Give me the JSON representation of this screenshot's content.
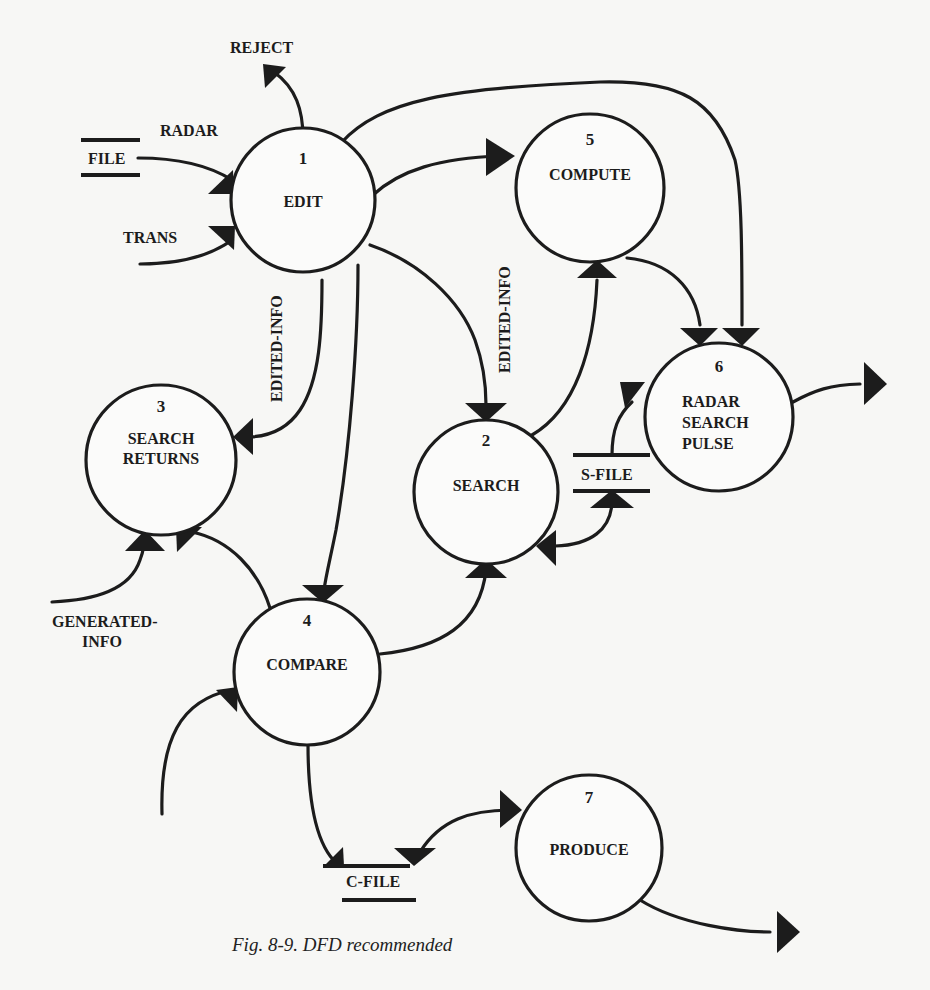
{
  "figure": {
    "caption": "Fig. 8-9. DFD recommended"
  },
  "processes": [
    {
      "id": "1",
      "number": "1",
      "name_lines": [
        "EDIT"
      ]
    },
    {
      "id": "2",
      "number": "2",
      "name_lines": [
        "SEARCH"
      ]
    },
    {
      "id": "3",
      "number": "3",
      "name_lines": [
        "SEARCH",
        "RETURNS"
      ]
    },
    {
      "id": "4",
      "number": "4",
      "name_lines": [
        "COMPARE"
      ]
    },
    {
      "id": "5",
      "number": "5",
      "name_lines": [
        "COMPUTE"
      ]
    },
    {
      "id": "6",
      "number": "6",
      "name_lines": [
        "RADAR",
        "SEARCH",
        "PULSE"
      ]
    },
    {
      "id": "7",
      "number": "7",
      "name_lines": [
        "PRODUCE"
      ]
    }
  ],
  "data_stores": [
    {
      "id": "radar-file",
      "label": "FILE"
    },
    {
      "id": "s-file",
      "label": "S-FILE"
    },
    {
      "id": "c-file",
      "label": "C-FILE"
    }
  ],
  "flow_labels": {
    "reject": "REJECT",
    "radar": "RADAR",
    "trans": "TRANS",
    "edited_info_to_3": "EDITED-INFO",
    "edited_info_to_2": "EDITED-INFO",
    "generated_info_line1": "GENERATED-",
    "generated_info_line2": "INFO"
  },
  "flows": [
    {
      "from": "radar-file",
      "to": "1",
      "label": "RADAR"
    },
    {
      "from": "external",
      "to": "1",
      "label": "TRANS"
    },
    {
      "from": "1",
      "to": "external",
      "label": "REJECT"
    },
    {
      "from": "1",
      "to": "5",
      "label": ""
    },
    {
      "from": "1",
      "to": "6",
      "label": ""
    },
    {
      "from": "1",
      "to": "2",
      "label": "EDITED-INFO"
    },
    {
      "from": "1",
      "to": "3",
      "label": "EDITED-INFO"
    },
    {
      "from": "1",
      "to": "4",
      "label": ""
    },
    {
      "from": "2",
      "to": "5",
      "label": ""
    },
    {
      "from": "5",
      "to": "6",
      "label": ""
    },
    {
      "from": "s-file",
      "to": "6",
      "label": ""
    },
    {
      "from": "s-file",
      "to": "2",
      "label": "",
      "bidirectional": true
    },
    {
      "from": "external",
      "to": "3",
      "label": "GENERATED-INFO"
    },
    {
      "from": "4",
      "to": "3",
      "label": ""
    },
    {
      "from": "4",
      "to": "2",
      "label": ""
    },
    {
      "from": "external",
      "to": "4",
      "label": ""
    },
    {
      "from": "4",
      "to": "c-file",
      "label": ""
    },
    {
      "from": "c-file",
      "to": "7",
      "label": "",
      "bidirectional": true
    },
    {
      "from": "6",
      "to": "external",
      "label": ""
    },
    {
      "from": "7",
      "to": "external",
      "label": ""
    }
  ]
}
